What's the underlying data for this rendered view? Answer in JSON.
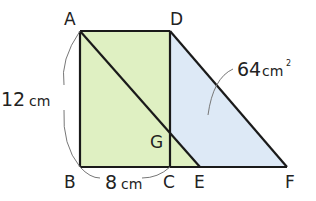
{
  "figure": {
    "points": {
      "A": "A",
      "B": "B",
      "C": "C",
      "D": "D",
      "E": "E",
      "F": "F",
      "G": "G"
    },
    "measures": {
      "ab_num": "12",
      "ab_unit": "cm",
      "bc_num": "8",
      "bc_unit": "cm",
      "area_num": "64",
      "area_unit": "cm",
      "area_sup": "2"
    },
    "colors": {
      "rectangle_fill": "#dff0c2",
      "triangle_fill": "#dde9f6",
      "stroke": "#1a1a1a"
    }
  }
}
